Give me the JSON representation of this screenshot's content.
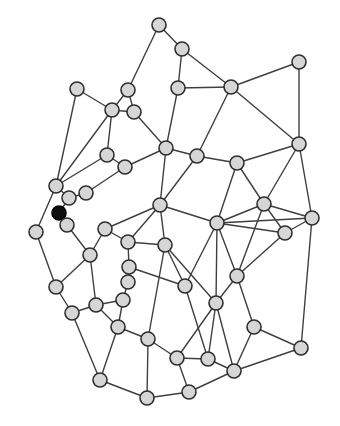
{
  "diagram": {
    "type": "undirected-network-graph",
    "canvas": {
      "width": 340,
      "height": 426,
      "background": "#ffffff"
    },
    "style": {
      "node_radius": 7,
      "node_fill": "#d6d6d6",
      "node_stroke": "#2e2e2e",
      "node_stroke_width": 1.6,
      "highlight_fill": "#0d0d0d",
      "highlight_stroke": "#000000",
      "edge_color": "#3f3f3f",
      "edge_width": 1.4
    },
    "nodes": [
      {
        "id": 0,
        "x": 159,
        "y": 25,
        "highlighted": false
      },
      {
        "id": 1,
        "x": 182,
        "y": 49,
        "highlighted": false
      },
      {
        "id": 2,
        "x": 77,
        "y": 89,
        "highlighted": false
      },
      {
        "id": 3,
        "x": 128,
        "y": 90,
        "highlighted": false
      },
      {
        "id": 4,
        "x": 178,
        "y": 88,
        "highlighted": false
      },
      {
        "id": 5,
        "x": 231,
        "y": 87,
        "highlighted": false
      },
      {
        "id": 6,
        "x": 299,
        "y": 62,
        "highlighted": false
      },
      {
        "id": 7,
        "x": 112,
        "y": 110,
        "highlighted": false
      },
      {
        "id": 8,
        "x": 134,
        "y": 112,
        "highlighted": false
      },
      {
        "id": 9,
        "x": 299,
        "y": 144,
        "highlighted": false
      },
      {
        "id": 10,
        "x": 107,
        "y": 155,
        "highlighted": false
      },
      {
        "id": 11,
        "x": 125,
        "y": 167,
        "highlighted": false
      },
      {
        "id": 12,
        "x": 166,
        "y": 148,
        "highlighted": false
      },
      {
        "id": 13,
        "x": 197,
        "y": 156,
        "highlighted": false
      },
      {
        "id": 14,
        "x": 237,
        "y": 163,
        "highlighted": false
      },
      {
        "id": 15,
        "x": 56,
        "y": 186,
        "highlighted": false
      },
      {
        "id": 16,
        "x": 69,
        "y": 198,
        "highlighted": false
      },
      {
        "id": 17,
        "x": 86,
        "y": 193,
        "highlighted": false
      },
      {
        "id": 18,
        "x": 59,
        "y": 213,
        "highlighted": true
      },
      {
        "id": 19,
        "x": 67,
        "y": 225,
        "highlighted": false
      },
      {
        "id": 20,
        "x": 36,
        "y": 232,
        "highlighted": false
      },
      {
        "id": 21,
        "x": 90,
        "y": 255,
        "highlighted": false
      },
      {
        "id": 22,
        "x": 56,
        "y": 287,
        "highlighted": false
      },
      {
        "id": 23,
        "x": 160,
        "y": 205,
        "highlighted": false
      },
      {
        "id": 24,
        "x": 217,
        "y": 223,
        "highlighted": false
      },
      {
        "id": 25,
        "x": 264,
        "y": 204,
        "highlighted": false
      },
      {
        "id": 26,
        "x": 312,
        "y": 218,
        "highlighted": false
      },
      {
        "id": 27,
        "x": 285,
        "y": 233,
        "highlighted": false
      },
      {
        "id": 28,
        "x": 105,
        "y": 229,
        "highlighted": false
      },
      {
        "id": 29,
        "x": 128,
        "y": 242,
        "highlighted": false
      },
      {
        "id": 30,
        "x": 165,
        "y": 245,
        "highlighted": false
      },
      {
        "id": 31,
        "x": 129,
        "y": 267,
        "highlighted": false
      },
      {
        "id": 32,
        "x": 128,
        "y": 282,
        "highlighted": false
      },
      {
        "id": 33,
        "x": 123,
        "y": 300,
        "highlighted": false
      },
      {
        "id": 34,
        "x": 96,
        "y": 305,
        "highlighted": false
      },
      {
        "id": 35,
        "x": 72,
        "y": 313,
        "highlighted": false
      },
      {
        "id": 36,
        "x": 118,
        "y": 327,
        "highlighted": false
      },
      {
        "id": 37,
        "x": 148,
        "y": 339,
        "highlighted": false
      },
      {
        "id": 38,
        "x": 185,
        "y": 286,
        "highlighted": false
      },
      {
        "id": 39,
        "x": 216,
        "y": 303,
        "highlighted": false
      },
      {
        "id": 40,
        "x": 237,
        "y": 276,
        "highlighted": false
      },
      {
        "id": 41,
        "x": 254,
        "y": 327,
        "highlighted": false
      },
      {
        "id": 42,
        "x": 301,
        "y": 348,
        "highlighted": false
      },
      {
        "id": 43,
        "x": 177,
        "y": 358,
        "highlighted": false
      },
      {
        "id": 44,
        "x": 208,
        "y": 359,
        "highlighted": false
      },
      {
        "id": 45,
        "x": 234,
        "y": 371,
        "highlighted": false
      },
      {
        "id": 46,
        "x": 100,
        "y": 380,
        "highlighted": false
      },
      {
        "id": 47,
        "x": 147,
        "y": 398,
        "highlighted": false
      },
      {
        "id": 48,
        "x": 189,
        "y": 392,
        "highlighted": false
      }
    ],
    "edges": [
      [
        0,
        1
      ],
      [
        0,
        3
      ],
      [
        1,
        4
      ],
      [
        1,
        5
      ],
      [
        4,
        5
      ],
      [
        5,
        6
      ],
      [
        6,
        9
      ],
      [
        5,
        9
      ],
      [
        5,
        13
      ],
      [
        4,
        12
      ],
      [
        3,
        8
      ],
      [
        3,
        7
      ],
      [
        2,
        7
      ],
      [
        2,
        15
      ],
      [
        7,
        8
      ],
      [
        7,
        10
      ],
      [
        7,
        15
      ],
      [
        8,
        12
      ],
      [
        10,
        11
      ],
      [
        10,
        15
      ],
      [
        11,
        12
      ],
      [
        11,
        17
      ],
      [
        12,
        13
      ],
      [
        12,
        23
      ],
      [
        13,
        14
      ],
      [
        13,
        23
      ],
      [
        14,
        9
      ],
      [
        14,
        25
      ],
      [
        14,
        24
      ],
      [
        9,
        25
      ],
      [
        9,
        26
      ],
      [
        25,
        26
      ],
      [
        25,
        27
      ],
      [
        25,
        24
      ],
      [
        25,
        40
      ],
      [
        26,
        27
      ],
      [
        26,
        24
      ],
      [
        26,
        42
      ],
      [
        27,
        24
      ],
      [
        27,
        40
      ],
      [
        24,
        23
      ],
      [
        24,
        38
      ],
      [
        24,
        39
      ],
      [
        24,
        40
      ],
      [
        23,
        28
      ],
      [
        23,
        29
      ],
      [
        23,
        30
      ],
      [
        28,
        21
      ],
      [
        28,
        29
      ],
      [
        29,
        31
      ],
      [
        29,
        30
      ],
      [
        30,
        37
      ],
      [
        30,
        39
      ],
      [
        30,
        38
      ],
      [
        31,
        32
      ],
      [
        31,
        38
      ],
      [
        32,
        33
      ],
      [
        33,
        34
      ],
      [
        33,
        36
      ],
      [
        34,
        21
      ],
      [
        34,
        35
      ],
      [
        34,
        36
      ],
      [
        35,
        22
      ],
      [
        35,
        46
      ],
      [
        36,
        37
      ],
      [
        36,
        46
      ],
      [
        37,
        43
      ],
      [
        37,
        47
      ],
      [
        38,
        44
      ],
      [
        39,
        40
      ],
      [
        39,
        43
      ],
      [
        39,
        44
      ],
      [
        39,
        45
      ],
      [
        40,
        41
      ],
      [
        41,
        42
      ],
      [
        41,
        45
      ],
      [
        42,
        45
      ],
      [
        43,
        44
      ],
      [
        43,
        48
      ],
      [
        44,
        45
      ],
      [
        45,
        48
      ],
      [
        46,
        47
      ],
      [
        47,
        48
      ],
      [
        15,
        16
      ],
      [
        15,
        20
      ],
      [
        16,
        17
      ],
      [
        16,
        18
      ],
      [
        18,
        19
      ],
      [
        19,
        21
      ],
      [
        20,
        22
      ],
      [
        21,
        22
      ]
    ]
  }
}
